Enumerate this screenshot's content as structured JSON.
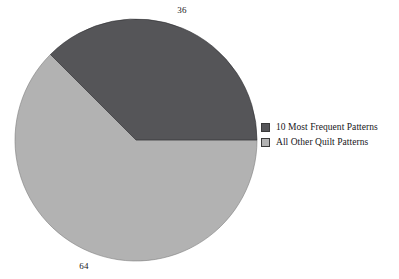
{
  "chart_data": {
    "type": "pie",
    "title": "",
    "subtitle": "",
    "xlabel": "",
    "ylabel": "",
    "grid": false,
    "legend_position": "right",
    "start_angle_deg": 315,
    "direction": "clockwise",
    "categories": [
      "10 Most Frequent Patterns",
      "All Other Quilt Patterns"
    ],
    "values": [
      36,
      64
    ],
    "value_labels": [
      "36",
      "64"
    ],
    "units": "percent",
    "slices": [
      {
        "label": "10 Most Frequent Patterns",
        "value": 36,
        "value_label": "36",
        "color": "#555558",
        "start_angle_deg": 315,
        "end_angle_deg": 90
      },
      {
        "label": "All Other Quilt Patterns",
        "value": 64,
        "value_label": "64",
        "color": "#b2b2b2",
        "start_angle_deg": 90,
        "end_angle_deg": 315
      }
    ],
    "legend": [
      {
        "label": "10 Most Frequent Patterns",
        "color": "#555558"
      },
      {
        "label": "All Other Quilt Patterns",
        "color": "#b2b2b2"
      }
    ]
  },
  "colors": {
    "background": "#ffffff",
    "dark_slice": "#555558",
    "light_slice": "#b2b2b2",
    "outline": "#3a3a3a",
    "text": "#16161a"
  },
  "geometry": {
    "center_x": 136,
    "center_y": 140,
    "radius": 121
  }
}
